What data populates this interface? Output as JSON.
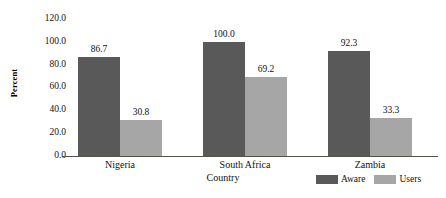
{
  "chart_data": {
    "type": "bar",
    "title": "",
    "xlabel": "Country",
    "ylabel": "Percent",
    "categories": [
      "Nigeria",
      "South Africa",
      "Zambia"
    ],
    "series": [
      {
        "name": "Aware",
        "color": "#595959",
        "values": [
          86.7,
          100.0,
          92.3
        ]
      },
      {
        "name": "Users",
        "color": "#a6a6a6",
        "values": [
          30.8,
          69.2,
          33.3
        ]
      }
    ],
    "value_labels": [
      [
        "86.7",
        "30.8"
      ],
      [
        "100.0",
        "69.2"
      ],
      [
        "92.3",
        "33.3"
      ]
    ],
    "ylim": [
      0.0,
      120.0
    ],
    "ytick_step": 20.0,
    "ytick_labels": [
      "120.0",
      "100.0",
      "80.0",
      "60.0",
      "40.0",
      "20.0",
      "0.0"
    ],
    "ytick_values": [
      120.0,
      100.0,
      80.0,
      60.0,
      40.0,
      20.0,
      0.0
    ],
    "grid": false,
    "legend_position": "bottom-right",
    "axis_color": "#55524e",
    "background": "#ffffff"
  },
  "legend": {
    "items": [
      {
        "label": "Aware",
        "color": "#595959"
      },
      {
        "label": "Users",
        "color": "#a6a6a6"
      }
    ]
  }
}
